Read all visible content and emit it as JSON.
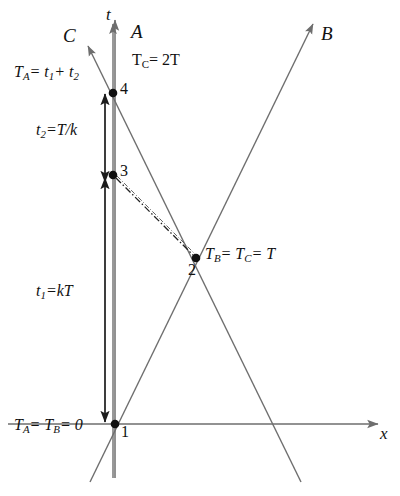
{
  "figure": {
    "type": "spacetime-diagram",
    "background": "#ffffff",
    "line_color": "#6e6e6e",
    "measure_color": "#222222",
    "text_color": "#111111"
  },
  "axes": {
    "time": {
      "label": "t",
      "x": 115,
      "top": 18,
      "bottom": 478,
      "arrow": "up"
    },
    "space": {
      "label": "x",
      "y": 424,
      "left": 8,
      "right": 382,
      "arrow": "right"
    }
  },
  "worldlines": [
    {
      "name": "A",
      "label": "A",
      "label_x": 131,
      "label_y": 22,
      "x1": 113,
      "y1": 22,
      "x2": 113,
      "y2": 478,
      "arrow": "up",
      "note": "vertical observer A"
    },
    {
      "name": "B",
      "label": "B",
      "label_x": 320,
      "label_y": 22,
      "x1": 90,
      "y1": 482,
      "x2": 312,
      "y2": 22,
      "arrow": "up-right",
      "note": "observer B moving right"
    },
    {
      "name": "C",
      "label": "C",
      "label_x": 64,
      "label_y": 26,
      "x1": 300,
      "y1": 482,
      "x2": 88,
      "y2": 45,
      "arrow": "up-left",
      "note": "observer C moving left"
    }
  ],
  "signals": [
    {
      "name": "light-signal-1-to-2",
      "style": "solid-thin",
      "x1": 115,
      "y1": 424,
      "x2": 273,
      "y2": 424
    },
    {
      "name": "signal-3-to-2",
      "style": "dash-dot",
      "x1": 116,
      "y1": 178,
      "x2": 195,
      "y2": 257
    }
  ],
  "events": [
    {
      "id": "1",
      "label": "1",
      "x": 115,
      "y": 424,
      "label_x": 122,
      "label_y": 428
    },
    {
      "id": "2",
      "label": "2",
      "x": 196,
      "y": 258,
      "label_x": 190,
      "label_y": 262
    },
    {
      "id": "3",
      "label": "3",
      "x": 113,
      "y": 175,
      "label_x": 120,
      "label_y": 165
    },
    {
      "id": "4",
      "label": "4",
      "x": 113,
      "y": 93,
      "label_x": 120,
      "label_y": 83
    }
  ],
  "measures": [
    {
      "name": "t2-interval",
      "x": 105,
      "y_top": 93,
      "y_bottom": 178,
      "arrows": "both"
    },
    {
      "name": "t1-interval",
      "x": 105,
      "y_top": 182,
      "y_bottom": 423,
      "arrows": "both"
    }
  ],
  "annotations": {
    "T_A_total": {
      "base": "T",
      "sub": "A",
      "rest": "= t",
      "sub2": "1",
      "plus": "+ t",
      "sub3": "2",
      "x": 14,
      "y": 68
    },
    "T_C_value": {
      "base": "T",
      "sub": "C",
      "rest": "= 2T",
      "x": 130,
      "y": 56
    },
    "t2_value": {
      "base": "t",
      "sub": "2",
      "rest": "=T/k",
      "x": 36,
      "y": 126
    },
    "t1_value": {
      "base": "t",
      "sub": "1",
      "rest": "=kT",
      "x": 36,
      "y": 287
    },
    "T_B_eq_T_C": {
      "base": "T",
      "sub": "B",
      "rest": "= T",
      "sub2": "C",
      "rest2": "= T",
      "x": 204,
      "y": 248
    },
    "origin_zero": {
      "base": "T",
      "sub": "A",
      "rest": "= T",
      "sub2": "B",
      "rest2": "= 0",
      "x": 14,
      "y": 420
    }
  },
  "text_values": {
    "axis_t": "t",
    "axis_x": "x",
    "frame_A": "A",
    "frame_B": "B",
    "frame_C": "C",
    "event_1": "1",
    "event_2": "2",
    "event_3": "3",
    "event_4": "4",
    "TA_sum": "T",
    "TA_sum_sub": "A",
    "TA_sum_tail": "= t",
    "TA_sum_sub1": "1",
    "TA_sum_mid": "+ t",
    "TA_sum_sub2": "2",
    "TC": "T",
    "TC_sub": "C",
    "TC_tail": "= 2T",
    "t2": "t",
    "t2_sub": "2",
    "t2_tail": "=T/k",
    "t1": "t",
    "t1_sub": "1",
    "t1_tail": "=kT",
    "TB": "T",
    "TB_sub": "B",
    "TB_tail": "= T",
    "TB_sub2": "C",
    "TB_tail2": "= T",
    "zero_TA": "T",
    "zero_TA_sub": "A",
    "zero_mid": "= T",
    "zero_TB_sub": "B",
    "zero_tail": "= 0"
  }
}
